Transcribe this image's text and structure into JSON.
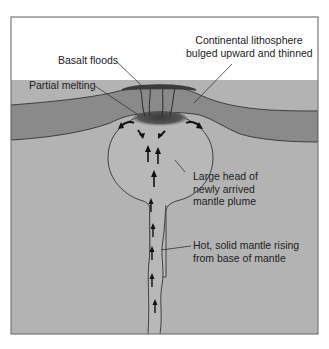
{
  "diagram": {
    "type": "cross-section",
    "colors": {
      "background": "#ffffff",
      "frame": "#777777",
      "lithosphere": "#8a8a8a",
      "mantle": "#b3b3b3",
      "plume_head": "#b8b8b8",
      "melt_zone": "#4a4a4a",
      "basalt": "#3c3c3c",
      "outline": "#333333",
      "arrows": "#111111",
      "text": "#222222"
    },
    "labels": {
      "lithosphere": {
        "lines": [
          "Continental lithosphere",
          "bulged upward and thinned"
        ]
      },
      "basalt_floods": {
        "text": "Basalt floods"
      },
      "partial_melting": {
        "text": "Partial melting"
      },
      "plume_head": {
        "lines": [
          "Large head of",
          "newly arrived",
          "mantle plume"
        ]
      },
      "plume_tail": {
        "lines": [
          "Hot, solid mantle rising",
          "from base of mantle"
        ]
      }
    }
  }
}
